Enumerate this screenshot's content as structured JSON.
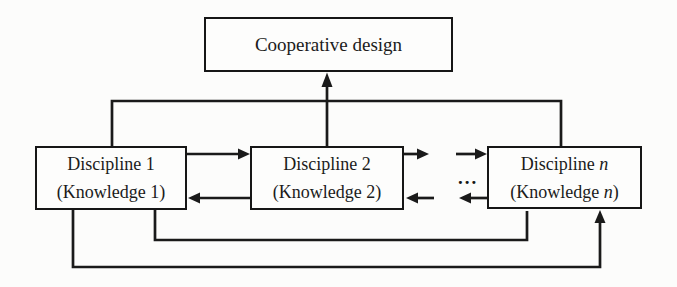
{
  "diagram": {
    "cooperative_box": {
      "label": "Cooperative design"
    },
    "disciplines": [
      {
        "title": "Discipline 1",
        "subtitle": "(Knowledge 1)"
      },
      {
        "title": "Discipline 2",
        "subtitle": "(Knowledge 2)"
      },
      {
        "title_prefix": "Discipline ",
        "title_var": "n",
        "subtitle_prefix": "(Knowledge ",
        "subtitle_var": "n",
        "subtitle_suffix": ")"
      }
    ],
    "ellipsis": "...",
    "colors": {
      "background": "#fcfcfb",
      "line": "#1a1a1a",
      "box_fill": "#fdfdfc",
      "text": "#1b1b1b"
    },
    "connectors": [
      {
        "name": "disc1-discn-top-link",
        "type": "line"
      },
      {
        "name": "disc2-to-cooperative",
        "type": "arrow-up"
      },
      {
        "name": "disc1-to-disc2",
        "type": "arrow-right"
      },
      {
        "name": "disc2-to-disc1",
        "type": "arrow-left"
      },
      {
        "name": "disc2-forward-out",
        "type": "arrow-right"
      },
      {
        "name": "into-discn-forward",
        "type": "arrow-right"
      },
      {
        "name": "into-disc2-backward",
        "type": "arrow-left"
      },
      {
        "name": "discn-backward-out",
        "type": "arrow-left"
      },
      {
        "name": "disc1-discn-middle-feedback",
        "type": "line"
      },
      {
        "name": "disc1-to-discn-bottom-feedback",
        "type": "arrow-up"
      }
    ]
  }
}
